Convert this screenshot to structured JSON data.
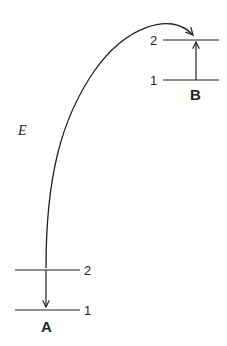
{
  "diagram": {
    "system_a": {
      "name": "A",
      "upper_level": "2",
      "lower_level": "1",
      "transition": "downward (2 to 1)"
    },
    "system_b": {
      "name": "B",
      "upper_level": "2",
      "lower_level": "1",
      "transition": "upward (1 to 2)"
    },
    "energy_transfer": {
      "label": "E",
      "from": "A",
      "to": "B"
    }
  }
}
